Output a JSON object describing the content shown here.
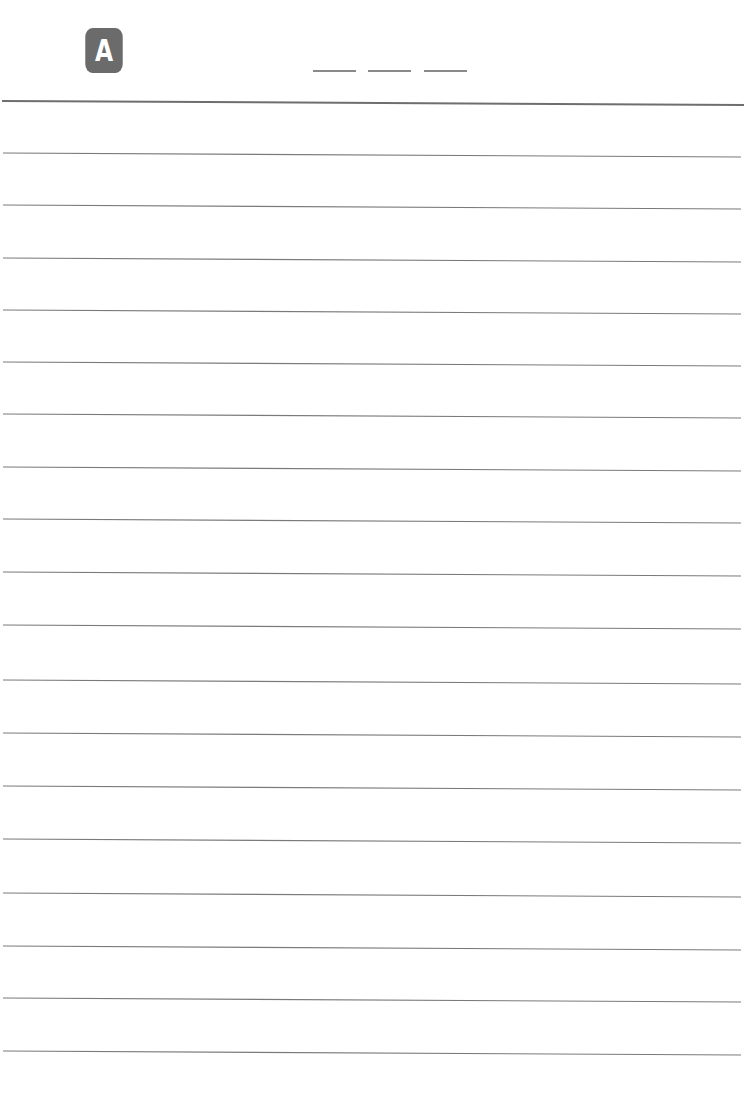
{
  "page": {
    "type": "ruled-notebook-page",
    "background_color": "#ffffff",
    "rule_color": "#7a7a7a",
    "header_rule_color": "#6e6e6e"
  },
  "header": {
    "letter_box": {
      "letter": "A",
      "background_color": "#6b6b6b",
      "text_color": "#ffffff"
    },
    "date_field": {
      "segments": 3,
      "dashes": [
        {
          "x": 0,
          "width": 43
        },
        {
          "x": 55,
          "width": 43
        },
        {
          "x": 111,
          "width": 43
        }
      ]
    },
    "header_rule": {
      "y_left": 101,
      "y_right": 105,
      "thickness": 2
    }
  },
  "rules": {
    "count": 18,
    "tilt_px": 4,
    "lines_y_left": [
      153,
      205,
      258,
      310,
      362,
      414,
      467,
      519,
      572,
      625,
      680,
      733,
      786,
      839,
      893,
      946,
      998,
      1051
    ]
  }
}
